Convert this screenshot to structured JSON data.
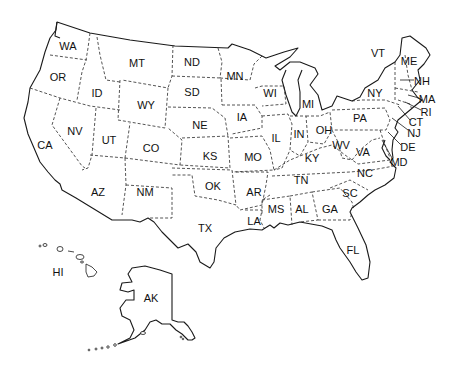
{
  "map": {
    "title": "United States",
    "states": [
      {
        "abbr": "WA",
        "x": 68,
        "y": 46
      },
      {
        "abbr": "OR",
        "x": 58,
        "y": 77
      },
      {
        "abbr": "CA",
        "x": 45,
        "y": 145
      },
      {
        "abbr": "ID",
        "x": 97,
        "y": 93
      },
      {
        "abbr": "NV",
        "x": 75,
        "y": 131
      },
      {
        "abbr": "MT",
        "x": 137,
        "y": 63
      },
      {
        "abbr": "WY",
        "x": 146,
        "y": 105
      },
      {
        "abbr": "UT",
        "x": 109,
        "y": 140
      },
      {
        "abbr": "CO",
        "x": 151,
        "y": 148
      },
      {
        "abbr": "AZ",
        "x": 98,
        "y": 192
      },
      {
        "abbr": "NM",
        "x": 145,
        "y": 192
      },
      {
        "abbr": "ND",
        "x": 192,
        "y": 62
      },
      {
        "abbr": "SD",
        "x": 192,
        "y": 92
      },
      {
        "abbr": "NE",
        "x": 200,
        "y": 125
      },
      {
        "abbr": "KS",
        "x": 210,
        "y": 156
      },
      {
        "abbr": "OK",
        "x": 213,
        "y": 186
      },
      {
        "abbr": "TX",
        "x": 205,
        "y": 228
      },
      {
        "abbr": "MN",
        "x": 235,
        "y": 76
      },
      {
        "abbr": "IA",
        "x": 242,
        "y": 117
      },
      {
        "abbr": "MO",
        "x": 253,
        "y": 157
      },
      {
        "abbr": "AR",
        "x": 254,
        "y": 192
      },
      {
        "abbr": "LA",
        "x": 254,
        "y": 221
      },
      {
        "abbr": "WI",
        "x": 270,
        "y": 93
      },
      {
        "abbr": "IL",
        "x": 276,
        "y": 138
      },
      {
        "abbr": "MI",
        "x": 308,
        "y": 104
      },
      {
        "abbr": "IN",
        "x": 299,
        "y": 134
      },
      {
        "abbr": "OH",
        "x": 324,
        "y": 130
      },
      {
        "abbr": "KY",
        "x": 312,
        "y": 158
      },
      {
        "abbr": "TN",
        "x": 301,
        "y": 180
      },
      {
        "abbr": "MS",
        "x": 276,
        "y": 209
      },
      {
        "abbr": "AL",
        "x": 302,
        "y": 209
      },
      {
        "abbr": "GA",
        "x": 330,
        "y": 209
      },
      {
        "abbr": "FL",
        "x": 353,
        "y": 250
      },
      {
        "abbr": "SC",
        "x": 350,
        "y": 193
      },
      {
        "abbr": "NC",
        "x": 365,
        "y": 173
      },
      {
        "abbr": "VA",
        "x": 363,
        "y": 152
      },
      {
        "abbr": "WV",
        "x": 341,
        "y": 145
      },
      {
        "abbr": "PA",
        "x": 360,
        "y": 118
      },
      {
        "abbr": "NY",
        "x": 375,
        "y": 93
      },
      {
        "abbr": "VT",
        "x": 378,
        "y": 53
      },
      {
        "abbr": "ME",
        "x": 409,
        "y": 61
      },
      {
        "abbr": "NH",
        "x": 422,
        "y": 81
      },
      {
        "abbr": "MA",
        "x": 427,
        "y": 99
      },
      {
        "abbr": "RI",
        "x": 426,
        "y": 112
      },
      {
        "abbr": "CT",
        "x": 416,
        "y": 122
      },
      {
        "abbr": "NJ",
        "x": 414,
        "y": 133
      },
      {
        "abbr": "DE",
        "x": 408,
        "y": 147
      },
      {
        "abbr": "MD",
        "x": 399,
        "y": 162
      },
      {
        "abbr": "HI",
        "x": 58,
        "y": 272
      },
      {
        "abbr": "AK",
        "x": 151,
        "y": 298
      }
    ]
  }
}
